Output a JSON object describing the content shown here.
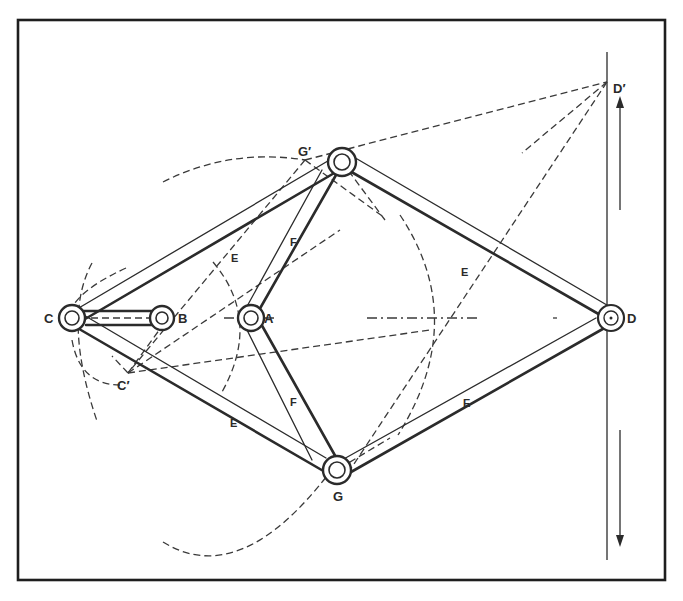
{
  "diagram": {
    "type": "mechanical-linkage",
    "frame": {
      "x1": 17,
      "y1": 19,
      "x2": 666,
      "y2": 581
    },
    "colors": {
      "ink": "#2b2b2b",
      "paper": "#ffffff"
    },
    "joints": [
      {
        "id": "C",
        "label": "C",
        "x": 72,
        "y": 318
      },
      {
        "id": "B",
        "label": "B",
        "x": 162,
        "y": 318
      },
      {
        "id": "A",
        "label": "A",
        "x": 251,
        "y": 318
      },
      {
        "id": "top",
        "label": "",
        "x": 342,
        "y": 162
      },
      {
        "id": "G",
        "label": "G",
        "x": 337,
        "y": 470
      },
      {
        "id": "D",
        "label": "D",
        "x": 611,
        "y": 318
      }
    ],
    "construction_points": [
      {
        "id": "Dprime",
        "label": "D′",
        "x": 607,
        "y": 82
      },
      {
        "id": "Gprime",
        "label": "G′",
        "x": 305,
        "y": 160
      },
      {
        "id": "Cprime",
        "label": "C′",
        "x": 128,
        "y": 373
      }
    ],
    "link_labels": [
      {
        "id": "E1",
        "label": "E",
        "x": 236,
        "y": 262
      },
      {
        "id": "E2",
        "label": "E",
        "x": 466,
        "y": 271
      },
      {
        "id": "E3",
        "label": "E",
        "x": 235,
        "y": 421
      },
      {
        "id": "E4",
        "label": "E",
        "x": 468,
        "y": 402
      },
      {
        "id": "F1",
        "label": "F",
        "x": 294,
        "y": 244
      },
      {
        "id": "F2",
        "label": "F",
        "x": 294,
        "y": 402
      }
    ],
    "motion_arrows": [
      {
        "direction": "up",
        "x": 620,
        "y_from": 210,
        "y_to": 98
      },
      {
        "direction": "down",
        "x": 620,
        "y_from": 430,
        "y_to": 545
      }
    ],
    "guide_line": {
      "x": 607,
      "y_from": 52,
      "y_to": 560
    }
  }
}
